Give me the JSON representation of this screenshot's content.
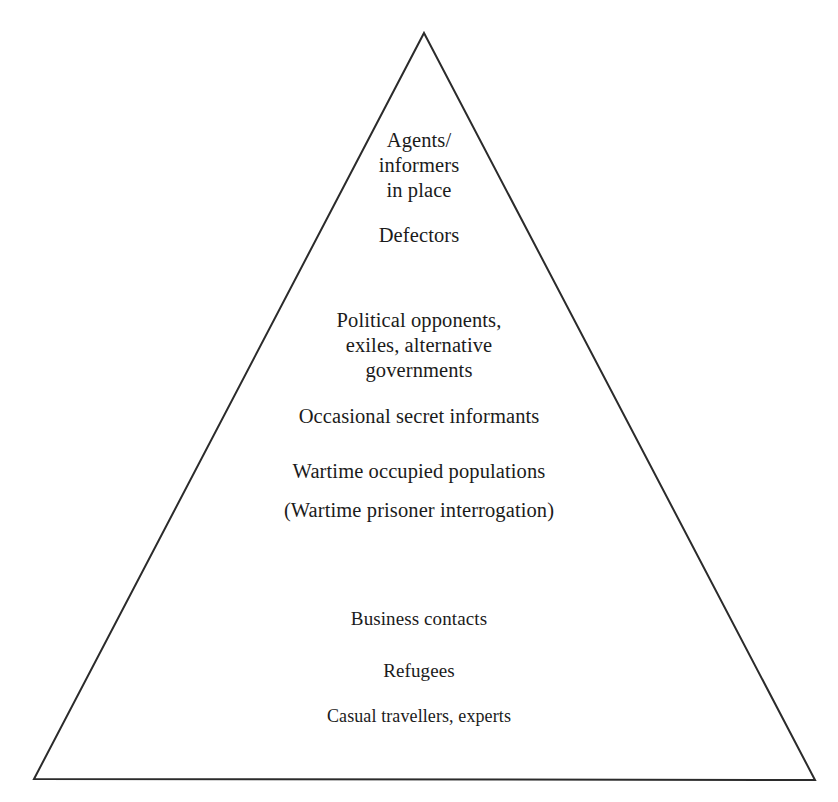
{
  "diagram": {
    "type": "pyramid",
    "shape_name": "triangle-outline",
    "background_color": "#ffffff",
    "outline_color": "#2b2b2b",
    "outline_width_px": 2,
    "text_color": "#1b1b1b",
    "apex": {
      "x": 424,
      "y": 33
    },
    "base_left": {
      "x": 34,
      "y": 779
    },
    "base_right": {
      "x": 815,
      "y": 780
    },
    "tiers": [
      {
        "id": "agents-informers-in-place",
        "text": "Agents/\ninformers\nin place",
        "lines": [
          "Agents/",
          "informers",
          "in place"
        ]
      },
      {
        "id": "defectors",
        "text": "Defectors",
        "lines": [
          "Defectors"
        ]
      },
      {
        "id": "political-opponents",
        "text": "Political opponents,\nexiles, alternative\ngovernments",
        "lines": [
          "Political opponents,",
          "exiles, alternative",
          "governments"
        ]
      },
      {
        "id": "occasional-secret-informants",
        "text": "Occasional secret informants",
        "lines": [
          "Occasional secret informants"
        ]
      },
      {
        "id": "wartime-occupied-populations",
        "text": "Wartime occupied populations",
        "lines": [
          "Wartime occupied populations"
        ]
      },
      {
        "id": "wartime-prisoner-interrogation",
        "text": "(Wartime prisoner interrogation)",
        "lines": [
          "(Wartime prisoner interrogation)"
        ]
      },
      {
        "id": "business-contacts",
        "text": "Business contacts",
        "lines": [
          "Business contacts"
        ]
      },
      {
        "id": "refugees",
        "text": "Refugees",
        "lines": [
          "Refugees"
        ]
      },
      {
        "id": "casual-travellers-experts",
        "text": "Casual travellers, experts",
        "lines": [
          "Casual travellers, experts"
        ]
      }
    ]
  }
}
